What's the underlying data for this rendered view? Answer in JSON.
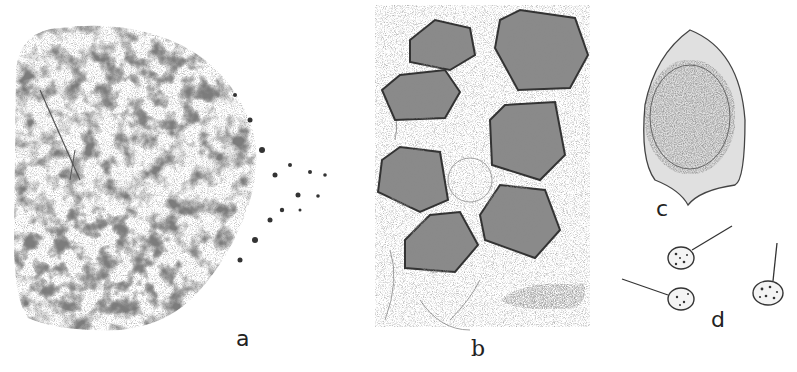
{
  "figure": {
    "panels": [
      {
        "id": "a",
        "label": "a",
        "description": "dense granular mass with scattered particles dispersing to the right"
      },
      {
        "id": "b",
        "label": "b",
        "description": "group of seven polyhedral particles with round inner cores in section"
      },
      {
        "id": "c",
        "label": "c",
        "description": "single large oval particle with pointed sheath"
      },
      {
        "id": "d",
        "label": "d",
        "description": "three small spherical bodies with tail fibres"
      }
    ],
    "colors": {
      "ink": "#2a2a2a",
      "mid": "#6b6b6b",
      "light": "#a8a8a8",
      "paper": "#ffffff"
    }
  }
}
